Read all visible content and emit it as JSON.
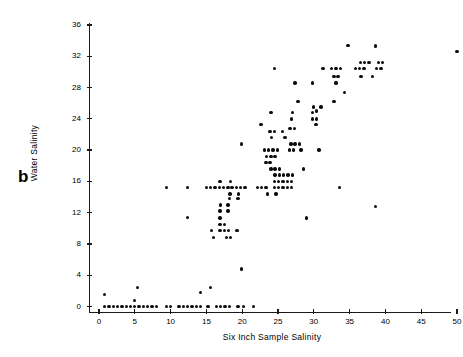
{
  "figure": {
    "panel_letter": "b",
    "background_color": "#ffffff",
    "marker_color": "#0d0d0d",
    "axis_color": "#1a1a1a"
  },
  "chart_data": {
    "type": "scatter",
    "title": "",
    "xlabel": "Six Inch Sample Salinity",
    "ylabel": "Water Salinity",
    "xlim": [
      0,
      51
    ],
    "ylim": [
      0,
      36
    ],
    "xticks": [
      0,
      5,
      10,
      15,
      20,
      25,
      30,
      35,
      40,
      45,
      50
    ],
    "xticklabels": [
      "0",
      "5",
      "10",
      "15",
      "20",
      "25",
      "30",
      "35",
      "40",
      "45",
      "50"
    ],
    "yticks": [
      0,
      4,
      8,
      12,
      16,
      20,
      24,
      28,
      32,
      36
    ],
    "yticklabels": [
      "0",
      "4",
      "8",
      "12",
      "16",
      "20",
      "24",
      "28",
      "32",
      "36"
    ],
    "grid": false,
    "legend": null,
    "marker": "filled-circle",
    "points": [
      [
        0.8,
        1.5
      ],
      [
        0.8,
        0.0
      ],
      [
        1.4,
        0.0
      ],
      [
        2.0,
        0.0
      ],
      [
        2.6,
        0.0
      ],
      [
        3.2,
        0.0
      ],
      [
        3.8,
        0.0
      ],
      [
        4.4,
        0.0
      ],
      [
        5.0,
        0.0
      ],
      [
        5.0,
        0.8
      ],
      [
        5.4,
        2.4
      ],
      [
        5.6,
        0.0
      ],
      [
        6.2,
        0.0
      ],
      [
        6.8,
        0.0
      ],
      [
        7.4,
        0.0
      ],
      [
        8.0,
        0.0
      ],
      [
        9.4,
        0.0
      ],
      [
        10.0,
        0.0
      ],
      [
        11.2,
        0.0
      ],
      [
        11.8,
        0.0
      ],
      [
        12.4,
        0.0
      ],
      [
        13.0,
        0.0
      ],
      [
        13.6,
        0.0
      ],
      [
        14.2,
        0.0
      ],
      [
        14.2,
        1.8
      ],
      [
        15.2,
        0.0
      ],
      [
        16.4,
        0.0
      ],
      [
        17.0,
        0.0
      ],
      [
        17.6,
        0.0
      ],
      [
        18.2,
        0.0
      ],
      [
        19.4,
        0.0
      ],
      [
        20.2,
        0.0
      ],
      [
        21.6,
        0.0
      ],
      [
        15.6,
        2.4
      ],
      [
        19.9,
        4.8
      ],
      [
        16.0,
        8.8
      ],
      [
        17.8,
        8.8
      ],
      [
        18.4,
        8.8
      ],
      [
        15.7,
        9.7
      ],
      [
        16.9,
        9.7
      ],
      [
        17.5,
        9.7
      ],
      [
        18.1,
        9.7
      ],
      [
        19.3,
        9.7
      ],
      [
        16.9,
        10.5
      ],
      [
        17.5,
        10.5
      ],
      [
        16.9,
        11.3
      ],
      [
        12.4,
        11.4
      ],
      [
        16.9,
        12.2
      ],
      [
        18.0,
        12.2
      ],
      [
        17.0,
        13.0
      ],
      [
        18.0,
        13.0
      ],
      [
        18.2,
        13.8
      ],
      [
        19.4,
        13.8
      ],
      [
        9.4,
        15.2
      ],
      [
        12.4,
        15.2
      ],
      [
        15.0,
        15.2
      ],
      [
        15.6,
        15.2
      ],
      [
        16.2,
        15.2
      ],
      [
        16.8,
        15.2
      ],
      [
        17.4,
        15.2
      ],
      [
        18.0,
        15.2
      ],
      [
        18.6,
        15.2
      ],
      [
        19.2,
        15.2
      ],
      [
        19.8,
        15.2
      ],
      [
        20.4,
        15.2
      ],
      [
        22.1,
        15.2
      ],
      [
        22.7,
        15.2
      ],
      [
        23.3,
        15.2
      ],
      [
        24.5,
        15.2
      ],
      [
        25.1,
        15.2
      ],
      [
        25.7,
        15.2
      ],
      [
        26.3,
        15.2
      ],
      [
        26.9,
        15.2
      ],
      [
        33.6,
        15.2
      ],
      [
        18.3,
        14.4
      ],
      [
        19.5,
        14.4
      ],
      [
        23.5,
        14.4
      ],
      [
        24.7,
        14.4
      ],
      [
        16.9,
        16.0
      ],
      [
        18.4,
        16.0
      ],
      [
        24.5,
        16.0
      ],
      [
        25.1,
        16.0
      ],
      [
        25.7,
        16.0
      ],
      [
        26.3,
        16.0
      ],
      [
        26.9,
        16.0
      ],
      [
        24.6,
        16.8
      ],
      [
        25.2,
        16.8
      ],
      [
        25.8,
        16.8
      ],
      [
        26.4,
        16.8
      ],
      [
        27.0,
        16.8
      ],
      [
        24.0,
        17.6
      ],
      [
        24.6,
        17.6
      ],
      [
        25.2,
        17.6
      ],
      [
        28.6,
        17.6
      ],
      [
        23.3,
        18.4
      ],
      [
        23.9,
        18.4
      ],
      [
        23.4,
        19.2
      ],
      [
        24.0,
        19.2
      ],
      [
        24.6,
        19.2
      ],
      [
        19.9,
        20.8
      ],
      [
        23.1,
        20.0
      ],
      [
        23.7,
        20.0
      ],
      [
        24.3,
        20.0
      ],
      [
        24.9,
        20.0
      ],
      [
        26.6,
        20.0
      ],
      [
        27.2,
        20.0
      ],
      [
        28.2,
        20.0
      ],
      [
        30.7,
        20.0
      ],
      [
        26.8,
        20.8
      ],
      [
        27.4,
        20.8
      ],
      [
        28.0,
        20.8
      ],
      [
        24.1,
        21.6
      ],
      [
        26.0,
        21.6
      ],
      [
        23.9,
        22.4
      ],
      [
        24.5,
        22.4
      ],
      [
        25.6,
        22.4
      ],
      [
        26.7,
        22.8
      ],
      [
        27.3,
        22.8
      ],
      [
        22.6,
        23.3
      ],
      [
        30.3,
        23.3
      ],
      [
        26.9,
        24.0
      ],
      [
        29.8,
        24.0
      ],
      [
        30.4,
        24.0
      ],
      [
        24.0,
        24.8
      ],
      [
        27.0,
        24.8
      ],
      [
        29.8,
        24.8
      ],
      [
        30.4,
        25.0
      ],
      [
        31.0,
        25.5
      ],
      [
        30.0,
        25.5
      ],
      [
        27.8,
        26.2
      ],
      [
        32.8,
        26.2
      ],
      [
        34.3,
        27.4
      ],
      [
        27.4,
        28.6
      ],
      [
        29.8,
        28.6
      ],
      [
        33.1,
        28.6
      ],
      [
        32.8,
        29.4
      ],
      [
        33.4,
        29.4
      ],
      [
        36.6,
        29.4
      ],
      [
        38.2,
        29.4
      ],
      [
        24.5,
        30.4
      ],
      [
        31.3,
        30.4
      ],
      [
        32.5,
        30.4
      ],
      [
        33.1,
        30.4
      ],
      [
        33.7,
        30.4
      ],
      [
        35.8,
        30.4
      ],
      [
        36.4,
        30.4
      ],
      [
        37.0,
        30.4
      ],
      [
        38.8,
        30.4
      ],
      [
        39.4,
        30.4
      ],
      [
        36.5,
        31.2
      ],
      [
        37.1,
        31.2
      ],
      [
        37.7,
        31.2
      ],
      [
        39.0,
        31.2
      ],
      [
        39.6,
        31.2
      ],
      [
        34.8,
        33.4
      ],
      [
        38.6,
        33.3
      ],
      [
        29.0,
        11.3
      ],
      [
        38.6,
        12.8
      ],
      [
        50.0,
        32.6
      ]
    ]
  }
}
